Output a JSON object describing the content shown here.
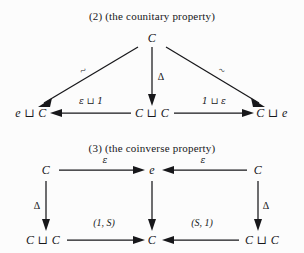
{
  "figure": {
    "background_color": "#fcfcfc",
    "ink_color": "#17171a",
    "diagrams": [
      {
        "id": "counitary",
        "caption": "(2) (the counitary property)",
        "shape": "triangle",
        "nodes": [
          {
            "name": "apex",
            "label": "C",
            "x": 152,
            "y": 38
          },
          {
            "name": "bottom-left",
            "label": "e ⊔ C",
            "x": 31,
            "y": 113
          },
          {
            "name": "bottom-mid",
            "label": "C ⊔ C",
            "x": 152,
            "y": 113
          },
          {
            "name": "bottom-right",
            "label": "C ⊔ e",
            "x": 272,
            "y": 113
          }
        ],
        "edges": [
          {
            "name": "apex-to-left",
            "from": "apex",
            "to": "bottom-left",
            "label": "~",
            "label_x": 83,
            "label_y": 70
          },
          {
            "name": "apex-to-mid",
            "from": "apex",
            "to": "bottom-mid",
            "label": "Δ",
            "label_x": 161,
            "label_y": 76
          },
          {
            "name": "apex-to-right",
            "from": "apex",
            "to": "bottom-right",
            "label": "~",
            "label_x": 222,
            "label_y": 70
          },
          {
            "name": "mid-to-left",
            "from": "bottom-mid",
            "to": "bottom-left",
            "label": "ε ⊔ 1",
            "label_x": 91,
            "label_y": 101
          },
          {
            "name": "mid-to-right",
            "from": "bottom-mid",
            "to": "bottom-right",
            "label": "1 ⊔ ε",
            "label_x": 214,
            "label_y": 101
          }
        ]
      },
      {
        "id": "coinverse",
        "caption": "(3) (the coinverse property)",
        "shape": "double-square",
        "nodes": [
          {
            "name": "top-left",
            "label": "C",
            "x": 46,
            "y": 170
          },
          {
            "name": "top-mid",
            "label": "e",
            "x": 152,
            "y": 170
          },
          {
            "name": "top-right",
            "label": "C",
            "x": 258,
            "y": 170
          },
          {
            "name": "bottom-left",
            "label": "C ⊔ C",
            "x": 43,
            "y": 240
          },
          {
            "name": "bottom-mid",
            "label": "C",
            "x": 152,
            "y": 240
          },
          {
            "name": "bottom-right",
            "label": "C ⊔ C",
            "x": 262,
            "y": 240
          }
        ],
        "edges": [
          {
            "name": "topleft-to-topmid",
            "from": "top-left",
            "to": "top-mid",
            "label": "ε",
            "label_x": 105,
            "label_y": 160
          },
          {
            "name": "topright-to-topmid",
            "from": "top-right",
            "to": "top-mid",
            "label": "ε",
            "label_x": 203,
            "label_y": 160
          },
          {
            "name": "topleft-to-bottomleft",
            "from": "top-left",
            "to": "bottom-left",
            "label": "Δ",
            "label_x": 37,
            "label_y": 205
          },
          {
            "name": "topmid-to-bottommid",
            "from": "top-mid",
            "to": "bottom-mid",
            "label": "",
            "label_x": 0,
            "label_y": 0
          },
          {
            "name": "topright-to-bottomright",
            "from": "top-right",
            "to": "bottom-right",
            "label": "Δ",
            "label_x": 266,
            "label_y": 205
          },
          {
            "name": "bottomleft-to-bottommid",
            "from": "bottom-left",
            "to": "bottom-mid",
            "label": "(1, S)",
            "label_x": 104,
            "label_y": 222
          },
          {
            "name": "bottomright-to-bottommid",
            "from": "bottom-right",
            "to": "bottom-mid",
            "label": "(S, 1)",
            "label_x": 202,
            "label_y": 222
          }
        ]
      }
    ]
  }
}
